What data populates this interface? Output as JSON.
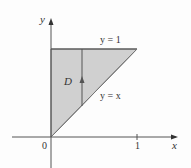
{
  "diagram": {
    "title": "",
    "axes": {
      "x_label": "x",
      "y_label": "y",
      "origin_label": "0",
      "x_tick_label": "1"
    },
    "region": {
      "label": "D",
      "fill_color": "#d0d0d0",
      "stroke_color": "#555555",
      "vertices": [
        [
          0,
          0
        ],
        [
          0,
          1
        ],
        [
          1,
          1
        ]
      ]
    },
    "curves": [
      {
        "label": "y = 1",
        "equation": "y=1"
      },
      {
        "label": "y = x",
        "equation": "y=x"
      }
    ],
    "vertical_strip": {
      "x": 0.36,
      "from": "y = x",
      "to": "y = 1",
      "arrow_direction": "up"
    }
  }
}
